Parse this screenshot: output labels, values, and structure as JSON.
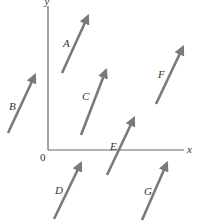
{
  "diagram": {
    "axes": {
      "origin_label": "0",
      "x_label": "x",
      "y_label": "y",
      "color": "#666666",
      "origin": [
        48,
        150
      ],
      "x_end": [
        184,
        150
      ],
      "y_end": [
        48,
        6
      ]
    },
    "arrow_color": "#7a7a7a",
    "vectors": [
      {
        "label": "A",
        "tail": [
          62,
          73
        ],
        "tip": [
          88,
          16
        ],
        "label_pos": [
          63,
          47
        ]
      },
      {
        "label": "B",
        "tail": [
          8,
          133
        ],
        "tip": [
          35,
          75
        ],
        "label_pos": [
          9,
          110
        ]
      },
      {
        "label": "C",
        "tail": [
          81,
          135
        ],
        "tip": [
          106,
          70
        ],
        "label_pos": [
          82,
          100
        ]
      },
      {
        "label": "D",
        "tail": [
          54,
          219
        ],
        "tip": [
          81,
          163
        ],
        "label_pos": [
          55,
          194
        ]
      },
      {
        "label": "E",
        "tail": [
          107,
          175
        ],
        "tip": [
          134,
          118
        ],
        "label_pos": [
          110,
          150
        ]
      },
      {
        "label": "F",
        "tail": [
          156,
          104
        ],
        "tip": [
          183,
          47
        ],
        "label_pos": [
          158,
          78
        ]
      },
      {
        "label": "G",
        "tail": [
          142,
          220
        ],
        "tip": [
          167,
          163
        ],
        "label_pos": [
          144,
          195
        ]
      }
    ]
  }
}
